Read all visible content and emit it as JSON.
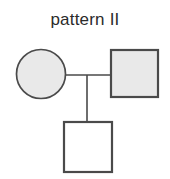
{
  "figure": {
    "title": "pattern II",
    "kind": "pedigree-chart",
    "background_color": "#ffffff",
    "stroke_color": "#4a4a4a",
    "shaded_fill": "#e9e9e9",
    "unshaded_fill": "#ffffff",
    "title_color": "#2b2b2b"
  },
  "individuals": [
    {
      "id": "mother",
      "symbol": "circle",
      "sex": "female",
      "status": "shaded",
      "generation": 1,
      "role": "parent",
      "center_x": 41,
      "center_y": 74,
      "radius": 24.5
    },
    {
      "id": "father",
      "symbol": "square",
      "sex": "male",
      "status": "shaded",
      "generation": 1,
      "role": "parent",
      "x": 111,
      "y": 50,
      "width": 47,
      "height": 47
    },
    {
      "id": "child",
      "symbol": "square",
      "sex": "male",
      "status": "unshaded",
      "generation": 2,
      "role": "offspring",
      "x": 64,
      "y": 122,
      "width": 48,
      "height": 50
    }
  ],
  "connections": [
    {
      "id": "mating-line",
      "type": "horizontal",
      "x1": 65,
      "y1": 75,
      "x2": 111,
      "y2": 75
    },
    {
      "id": "sibship-line",
      "type": "vertical",
      "x1": 87,
      "y1": 75,
      "x2": 87,
      "y2": 122
    }
  ]
}
